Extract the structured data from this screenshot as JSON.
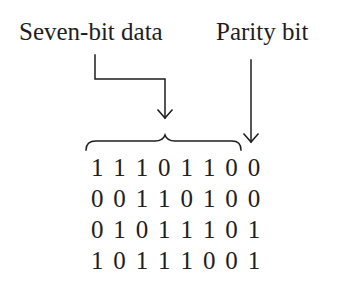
{
  "labels": {
    "data": "Seven-bit data",
    "parity": "Parity bit"
  },
  "rows": [
    {
      "bits": [
        "1",
        "1",
        "1",
        "0",
        "1",
        "1",
        "0",
        "0"
      ]
    },
    {
      "bits": [
        "0",
        "0",
        "1",
        "1",
        "0",
        "1",
        "0",
        "0"
      ]
    },
    {
      "bits": [
        "0",
        "1",
        "0",
        "1",
        "1",
        "1",
        "0",
        "1"
      ]
    },
    {
      "bits": [
        "1",
        "0",
        "1",
        "1",
        "1",
        "0",
        "0",
        "1"
      ]
    }
  ],
  "annotations": {
    "data_bits_count": 7,
    "parity_bits_count": 1
  },
  "colors": {
    "ink": "#1e1e1e",
    "background": "#ffffff"
  }
}
